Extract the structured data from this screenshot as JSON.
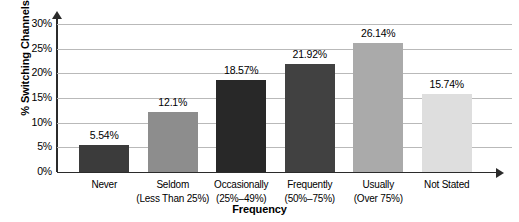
{
  "chart_data": {
    "type": "bar",
    "title": "",
    "xlabel": "Frequency",
    "ylabel": "% Switching Channels",
    "categories": [
      "Never",
      "Seldom",
      "Occasionally",
      "Frequently",
      "Usually",
      "Not Stated"
    ],
    "category_sublabels": [
      "",
      "(Less Than 25%)",
      "(25%–49%)",
      "(50%–75%)",
      "(Over 75%)",
      ""
    ],
    "values": [
      5.54,
      12.1,
      18.57,
      21.92,
      26.14,
      15.74
    ],
    "value_labels": [
      "5.54%",
      "12.1%",
      "18.57%",
      "21.92%",
      "26.14%",
      "15.74%"
    ],
    "bar_colors": [
      "#3b3b3b",
      "#8d8d8d",
      "#282828",
      "#414141",
      "#aaaaaa",
      "#dedede"
    ],
    "ylim": [
      0,
      30
    ],
    "ytick_values": [
      0,
      5,
      10,
      15,
      20,
      25,
      30
    ],
    "ytick_labels": [
      "0%",
      "5%",
      "10%",
      "15%",
      "20%",
      "25%",
      "30%"
    ],
    "grid": true,
    "legend": "none",
    "axis_color": "#2b2b2b",
    "gridline_color": "#b9b9b9",
    "background": "#ffffff"
  }
}
